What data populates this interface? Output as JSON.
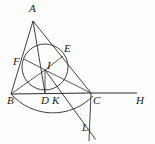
{
  "figure": {
    "type": "geometric-diagram",
    "canvas": {
      "width": 155,
      "height": 144
    },
    "stroke_color": "#2b2b2b",
    "label_color": "#1a1a1a",
    "background": "#fdfdfb"
  },
  "points": {
    "A": {
      "label": "A",
      "x": 33,
      "y": 21,
      "label_x": 29,
      "label_y": 3
    },
    "B": {
      "label": "B",
      "x": 11,
      "y": 94,
      "label_x": 7,
      "label_y": 95
    },
    "C": {
      "label": "C",
      "x": 91,
      "y": 93,
      "label_x": 93,
      "label_y": 95
    },
    "D": {
      "label": "D",
      "x": 45,
      "y": 93,
      "label_x": 41,
      "label_y": 95
    },
    "E": {
      "label": "E",
      "x": 63,
      "y": 56,
      "label_x": 64,
      "label_y": 43
    },
    "F": {
      "label": "F",
      "x": 24,
      "y": 59,
      "label_x": 13,
      "label_y": 56
    },
    "I": {
      "label": "I",
      "x": 45,
      "y": 70,
      "label_x": 47,
      "label_y": 60
    },
    "K": {
      "label": "K",
      "x": 56,
      "y": 93,
      "label_x": 52,
      "label_y": 95
    },
    "L": {
      "label": "L",
      "x": 88,
      "y": 129,
      "label_x": 82,
      "label_y": 122
    },
    "H": {
      "label": "H",
      "x": 137,
      "y": 93,
      "label_x": 136,
      "label_y": 95
    }
  },
  "incircle": {
    "name": "incircle",
    "center_x": 45,
    "center_y": 67,
    "radius": 23
  },
  "secondary_arc": {
    "name": "circumscribed-arc-through-B-K-C",
    "center_x": 53,
    "center_y": 55,
    "radius": 56
  },
  "segments": [
    {
      "name": "side-AB",
      "from": "A",
      "to": "B"
    },
    {
      "name": "side-AC",
      "from": "A",
      "to": "C"
    },
    {
      "name": "side-BC",
      "from": "B",
      "to": "C"
    },
    {
      "name": "base-extension-CH",
      "from": "C",
      "to": "H"
    },
    {
      "name": "cevian-AD",
      "from": "A",
      "to": "D"
    },
    {
      "name": "radius-IB",
      "from": "I",
      "to": "B"
    },
    {
      "name": "radius-IC",
      "from": "I",
      "to": "C"
    },
    {
      "name": "radius-IF",
      "from": "I",
      "to": "F"
    },
    {
      "name": "radius-ID",
      "from": "I",
      "to": "D"
    },
    {
      "name": "radius-IE",
      "from": "I",
      "to": "E"
    },
    {
      "name": "line-IL",
      "from": "I",
      "to": "L"
    },
    {
      "name": "vertical-CL",
      "from": "C",
      "to": "L"
    }
  ],
  "labels_order": [
    "A",
    "E",
    "F",
    "I",
    "B",
    "D",
    "K",
    "C",
    "H",
    "L"
  ]
}
